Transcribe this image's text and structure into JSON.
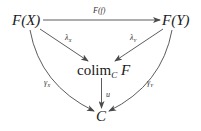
{
  "diagram": {
    "type": "commutative-diagram",
    "nodes": {
      "FX": "F(X)",
      "FY": "F(Y)",
      "colim": {
        "op": "colim",
        "sub": "C",
        "obj": "F"
      },
      "C": "C"
    },
    "arrows": [
      {
        "from": "F(X)",
        "to": "F(Y)",
        "label": "F(f)"
      },
      {
        "from": "F(X)",
        "to": "colim_C F",
        "label_base": "λ",
        "label_sub": "X"
      },
      {
        "from": "F(Y)",
        "to": "colim_C F",
        "label_base": "λ",
        "label_sub": "Y"
      },
      {
        "from": "F(X)",
        "to": "C",
        "label_base": "γ",
        "label_sub": "X"
      },
      {
        "from": "F(Y)",
        "to": "C",
        "label_base": "γ",
        "label_sub": "Y"
      },
      {
        "from": "colim_C F",
        "to": "C",
        "label": "u"
      }
    ],
    "colors": {
      "stroke": "#4a4a4a",
      "text": "#1a1a1a"
    }
  }
}
